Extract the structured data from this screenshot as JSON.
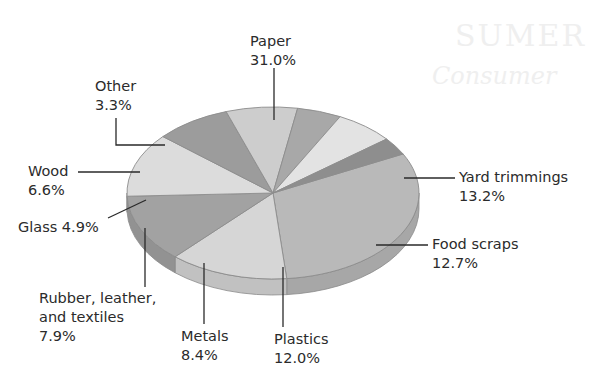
{
  "background_text": {
    "line1": "SUMER",
    "line2": "Consumer"
  },
  "chart_data": {
    "type": "pie",
    "style": "3d-tilted",
    "title": "",
    "start_angle_deg": -27,
    "slices": [
      {
        "label": "Paper",
        "value": 31.0,
        "display": "31.0%",
        "color": "#b9b9b9"
      },
      {
        "label": "Yard trimmings",
        "value": 13.2,
        "display": "13.2%",
        "color": "#d6d6d6"
      },
      {
        "label": "Food scraps",
        "value": 12.7,
        "display": "12.7%",
        "color": "#a2a2a2"
      },
      {
        "label": "Plastics",
        "value": 12.0,
        "display": "12.0%",
        "color": "#dcdcdc"
      },
      {
        "label": "Metals",
        "value": 8.4,
        "display": "8.4%",
        "color": "#9c9c9c"
      },
      {
        "label": "Rubber, leather, and textiles",
        "value": 7.9,
        "display": "7.9%",
        "color": "#cdcdcd"
      },
      {
        "label": "Glass",
        "value": 4.9,
        "display": "4.9%",
        "color": "#a8a8a8"
      },
      {
        "label": "Wood",
        "value": 6.6,
        "display": "6.6%",
        "color": "#e3e3e3"
      },
      {
        "label": "Other",
        "value": 3.3,
        "display": "3.3%",
        "color": "#8e8e8e"
      }
    ],
    "legend": "none (callout labels)"
  },
  "labels": {
    "paper": {
      "name": "Paper",
      "pct": "31.0%"
    },
    "yard": {
      "name": "Yard trimmings",
      "pct": "13.2%"
    },
    "food": {
      "name": "Food scraps",
      "pct": "12.7%"
    },
    "plastics": {
      "name": "Plastics",
      "pct": "12.0%"
    },
    "metals": {
      "name": "Metals",
      "pct": "8.4%"
    },
    "rubber": {
      "name1": "Rubber, leather,",
      "name2": "and textiles",
      "pct": "7.9%"
    },
    "glass": {
      "name": "Glass 4.9%"
    },
    "wood": {
      "name": "Wood",
      "pct": "6.6%"
    },
    "other": {
      "name": "Other",
      "pct": "3.3%"
    }
  }
}
